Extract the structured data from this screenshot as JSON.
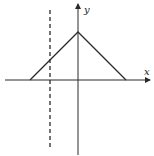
{
  "diagram": {
    "type": "graph-of-function",
    "axes": {
      "x_label": "x",
      "y_label": "y"
    },
    "shape": {
      "kind": "triangle",
      "apex": {
        "x": 78,
        "y": 32
      },
      "left_base": {
        "x": 30,
        "y": 80
      },
      "right_base": {
        "x": 126,
        "y": 80
      }
    },
    "dashed_line": {
      "x": 50,
      "y_top": 10,
      "y_bottom": 147
    },
    "colors": {
      "line": "#2a2a2a",
      "background": "#ffffff"
    }
  }
}
